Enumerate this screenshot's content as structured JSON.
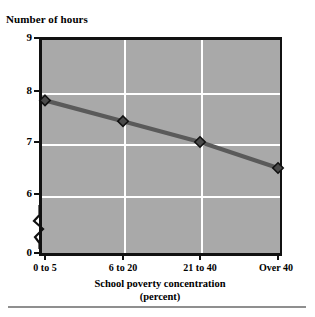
{
  "figure": {
    "y_axis_title": "Number of hours",
    "x_axis_caption": "School poverty concentration",
    "x_axis_caption_unit": "(percent)",
    "plot_background": "#a9a9a9",
    "gridline_color": "#ffffff",
    "series_color": "#5a5a5a",
    "marker_fill": "#4a4a4a",
    "marker_edge": "#111111",
    "axis_color": "#111111",
    "rule_color": "#8f8f8f"
  },
  "chart_data": {
    "type": "line",
    "title": "",
    "xlabel": "School poverty concentration (percent)",
    "ylabel": "Number of hours",
    "categories": [
      "0 to 5",
      "6 to 20",
      "21 to 40",
      "Over 40"
    ],
    "values": [
      7.8,
      7.4,
      7.0,
      6.5
    ],
    "series": [
      {
        "name": "Number of hours",
        "values": [
          7.8,
          7.4,
          7.0,
          6.5
        ]
      }
    ],
    "ylim": [
      6,
      9
    ],
    "yticks": [
      "9",
      "8",
      "7",
      "6",
      "0"
    ],
    "ytick_values": [
      9,
      8,
      7,
      6,
      0
    ],
    "axis_break": true,
    "axis_break_between": [
      0,
      6
    ],
    "grid": true,
    "legend": "none",
    "markers": "diamond"
  }
}
